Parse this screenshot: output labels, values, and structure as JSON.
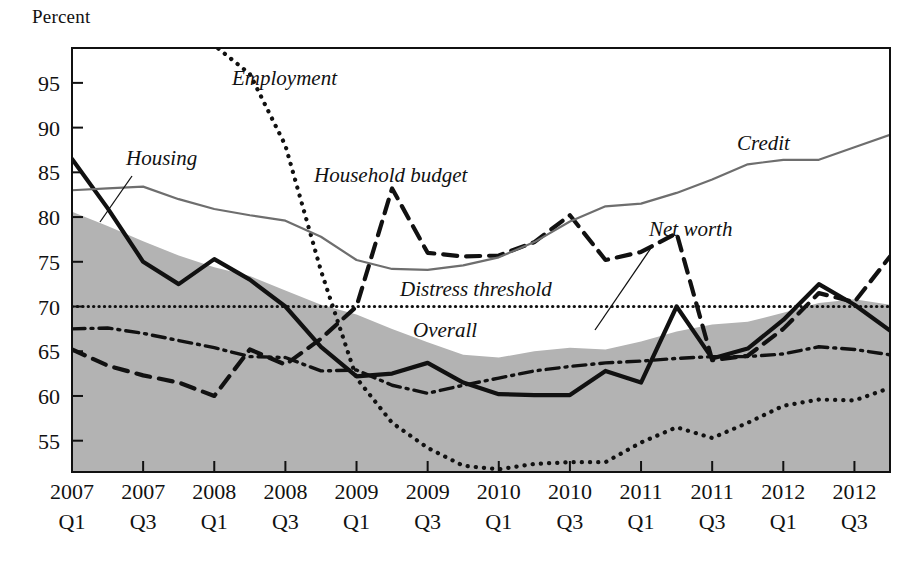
{
  "figure": {
    "y_axis_title": "Percent",
    "source_note": ""
  },
  "chart_data": {
    "type": "line",
    "title": "",
    "xlabel": "",
    "ylabel": "Percent",
    "ylim": [
      51.5,
      98.9
    ],
    "yticks": [
      55,
      60,
      65,
      70,
      75,
      80,
      85,
      90,
      95
    ],
    "grid": false,
    "legend_position": "inline-annotations",
    "x": [
      "2007 Q1",
      "2007 Q2",
      "2007 Q3",
      "2007 Q4",
      "2008 Q1",
      "2008 Q2",
      "2008 Q3",
      "2008 Q4",
      "2009 Q1",
      "2009 Q2",
      "2009 Q3",
      "2009 Q4",
      "2010 Q1",
      "2010 Q2",
      "2010 Q3",
      "2010 Q4",
      "2011 Q1",
      "2011 Q2",
      "2011 Q3",
      "2011 Q4",
      "2012 Q1",
      "2012 Q2",
      "2012 Q3",
      "2012 Q4"
    ],
    "xtick_labels": [
      {
        "year": "2007",
        "quarter": "Q1"
      },
      {
        "year": "2007",
        "quarter": "Q3"
      },
      {
        "year": "2008",
        "quarter": "Q1"
      },
      {
        "year": "2008",
        "quarter": "Q3"
      },
      {
        "year": "2009",
        "quarter": "Q1"
      },
      {
        "year": "2009",
        "quarter": "Q3"
      },
      {
        "year": "2010",
        "quarter": "Q1"
      },
      {
        "year": "2010",
        "quarter": "Q3"
      },
      {
        "year": "2011",
        "quarter": "Q1"
      },
      {
        "year": "2011",
        "quarter": "Q3"
      },
      {
        "year": "2012",
        "quarter": "Q1"
      },
      {
        "year": "2012",
        "quarter": "Q3"
      }
    ],
    "series": [
      {
        "name": "Overall",
        "label": "Overall",
        "style": "filled-area",
        "color": "#b3b3b3",
        "values": [
          80.6,
          79.0,
          77.3,
          75.7,
          74.4,
          73.4,
          71.8,
          70.2,
          69.1,
          67.5,
          66.0,
          64.6,
          64.3,
          65.0,
          65.4,
          65.2,
          66.1,
          67.2,
          68.0,
          68.3,
          69.3,
          70.4,
          70.8,
          70.2
        ]
      },
      {
        "name": "Employment",
        "label": "Employment",
        "style": "fine-dotted",
        "color": "#111111",
        "values": [
          99.5,
          99.5,
          99.5,
          99.5,
          99.2,
          96.0,
          88.0,
          74.0,
          62.0,
          57.0,
          54.2,
          52.2,
          51.8,
          52.4,
          52.6,
          52.6,
          54.8,
          56.5,
          55.3,
          57.0,
          58.9,
          59.6,
          59.5,
          60.9
        ]
      },
      {
        "name": "Housing",
        "label": "Housing",
        "style": "thick-solid",
        "color": "#111111",
        "values": [
          86.5,
          81.0,
          75.0,
          72.5,
          75.3,
          73.0,
          70.0,
          65.5,
          62.2,
          62.5,
          63.7,
          61.5,
          60.2,
          60.1,
          60.1,
          62.8,
          61.5,
          70.0,
          64.2,
          65.3,
          68.5,
          72.5,
          70.2,
          67.3
        ]
      },
      {
        "name": "Household budget",
        "label": "Household budget",
        "style": "thick-dashed",
        "color": "#111111",
        "values": [
          65.2,
          63.4,
          62.3,
          61.5,
          60.0,
          65.2,
          63.5,
          66.4,
          70.0,
          83.2,
          76.0,
          75.6,
          75.7,
          77.2,
          80.2,
          75.2,
          76.1,
          78.2,
          64.0,
          64.5,
          67.5,
          71.5,
          70.5,
          75.6
        ]
      },
      {
        "name": "Credit",
        "label": "Credit",
        "style": "thin-solid",
        "color": "#6e6e6e",
        "values": [
          83.0,
          83.2,
          83.4,
          82.0,
          80.9,
          80.2,
          79.6,
          77.8,
          75.2,
          74.2,
          74.1,
          74.6,
          75.5,
          77.2,
          79.5,
          81.2,
          81.5,
          82.7,
          84.2,
          85.9,
          86.4,
          86.4,
          87.8,
          89.2
        ]
      },
      {
        "name": "Net worth",
        "label": "Net worth",
        "style": "dash-dot",
        "color": "#111111",
        "values": [
          67.5,
          67.6,
          67.0,
          66.2,
          65.4,
          64.4,
          64.3,
          62.8,
          62.9,
          61.2,
          60.3,
          61.2,
          62.0,
          62.8,
          63.3,
          63.7,
          63.9,
          64.2,
          64.4,
          64.4,
          64.7,
          65.5,
          65.2,
          64.6
        ]
      }
    ],
    "reference_lines": [
      {
        "name": "Distress threshold",
        "label": "Distress threshold",
        "value": 70,
        "style": "dotted",
        "color": "#111111"
      }
    ],
    "annotations": [
      {
        "text": "Employment",
        "x_px": 232,
        "y_px": 85,
        "leader": false
      },
      {
        "text": "Housing",
        "x_px": 126,
        "y_px": 165,
        "leader": true
      },
      {
        "text": "Household budget",
        "x_px": 314,
        "y_px": 182,
        "leader": false
      },
      {
        "text": "Credit",
        "x_px": 737,
        "y_px": 150,
        "leader": false
      },
      {
        "text": "Net worth",
        "x_px": 649,
        "y_px": 236,
        "leader": true
      },
      {
        "text": "Distress threshold",
        "x_px": 400,
        "y_px": 296,
        "leader": false
      },
      {
        "text": "Overall",
        "x_px": 413,
        "y_px": 337,
        "leader": false
      }
    ]
  }
}
